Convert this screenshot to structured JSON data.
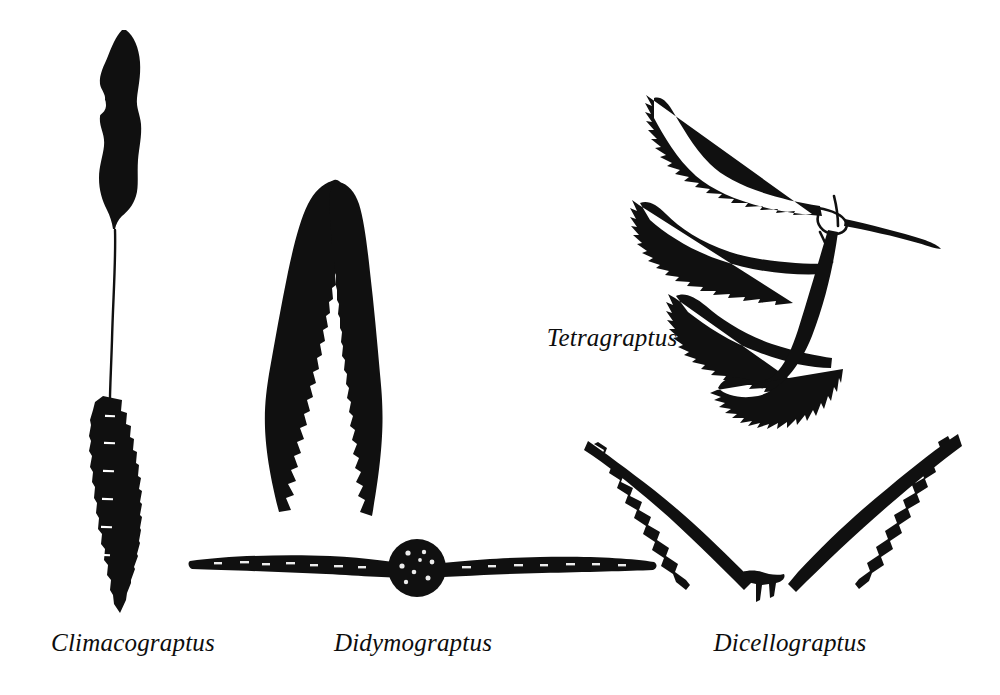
{
  "figure": {
    "background_color": "#ffffff",
    "ink_color": "#101010",
    "width": 1000,
    "height": 695
  },
  "specimens": [
    {
      "id": "climacograptus",
      "label": "Climacograptus",
      "label_x": 133,
      "label_y": 630,
      "form": "biserial-with-nema",
      "description": "solid elongate blob above a long thin nema leading to a notched biserial rachis"
    },
    {
      "id": "didymograptus-pendent",
      "label": "Didymograptus",
      "label_x": 413,
      "label_y": 630,
      "form": "tuning-fork-pendent",
      "description": "two pendent branches joined at a narrow apex, sawtooth thecae on inner edges"
    },
    {
      "id": "didymograptus-horizontal",
      "label": "",
      "form": "horizontal-with-disc",
      "description": "horizontal declined rhabdosome with dark circular disc at centre"
    },
    {
      "id": "tetragraptus",
      "label": "Tetragraptus",
      "label_x": 612,
      "label_y": 325,
      "form": "four-branched",
      "description": "four S-curved branches radiating from a node with a fine nema trailing right"
    },
    {
      "id": "dicellograptus",
      "label": "Dicellograptus",
      "label_x": 790,
      "label_y": 630,
      "form": "v-shaped-biramous",
      "description": "two reclined arms forming a V with hooked thecae and a sicula spike at the vertex"
    }
  ]
}
